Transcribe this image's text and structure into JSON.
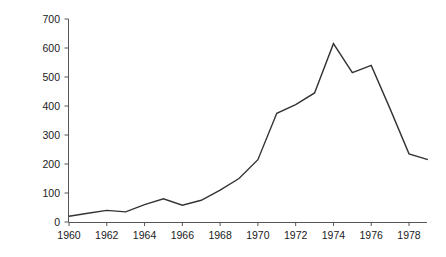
{
  "chart_data": {
    "type": "line",
    "title": "",
    "xlabel": "",
    "ylabel": "Number of patents",
    "xlim": [
      1960,
      1979
    ],
    "ylim": [
      0,
      700
    ],
    "grid": false,
    "legend": "none",
    "x_tick_labels": [
      "1960",
      "1962",
      "1964",
      "1966",
      "1968",
      "1970",
      "1972",
      "1974",
      "1976",
      "1978"
    ],
    "x_ticks": [
      1960,
      1962,
      1964,
      1966,
      1968,
      1970,
      1972,
      1974,
      1976,
      1978
    ],
    "y_tick_labels": [
      "0",
      "100",
      "200",
      "300",
      "400",
      "500",
      "600",
      "700"
    ],
    "y_ticks": [
      0,
      100,
      200,
      300,
      400,
      500,
      600,
      700
    ],
    "x": [
      1960,
      1961,
      1962,
      1963,
      1964,
      1965,
      1966,
      1967,
      1968,
      1969,
      1970,
      1971,
      1972,
      1973,
      1974,
      1975,
      1976,
      1977,
      1978,
      1979
    ],
    "values": [
      20,
      30,
      40,
      35,
      60,
      80,
      58,
      75,
      110,
      150,
      215,
      375,
      405,
      445,
      615,
      515,
      540,
      390,
      235,
      215
    ],
    "series": [
      {
        "name": "Number of patents",
        "color": "#333333",
        "values": [
          20,
          30,
          40,
          35,
          60,
          80,
          58,
          75,
          110,
          150,
          215,
          375,
          405,
          445,
          615,
          515,
          540,
          390,
          235,
          215
        ]
      }
    ],
    "line_color": "#333333",
    "axis_color": "#555555",
    "background": "#ffffff"
  }
}
